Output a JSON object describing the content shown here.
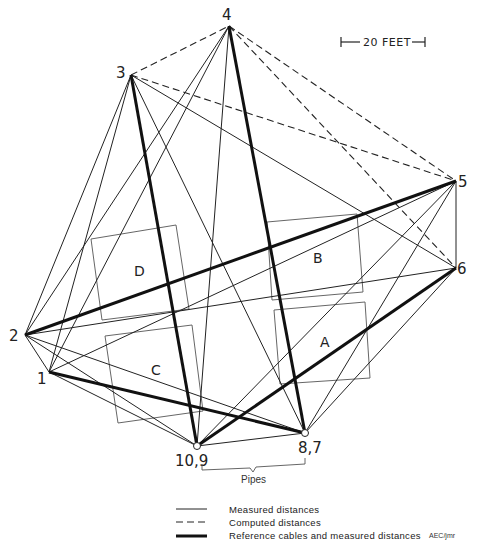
{
  "scale_bar": {
    "label": "20 FEET"
  },
  "points": [
    {
      "id": "1",
      "label": "1"
    },
    {
      "id": "2",
      "label": "2"
    },
    {
      "id": "3",
      "label": "3"
    },
    {
      "id": "4",
      "label": "4"
    },
    {
      "id": "5",
      "label": "5"
    },
    {
      "id": "6",
      "label": "6"
    },
    {
      "id": "87",
      "label": "8,7"
    },
    {
      "id": "109",
      "label": "10,9"
    }
  ],
  "squares": [
    {
      "id": "A",
      "label": "A"
    },
    {
      "id": "B",
      "label": "B"
    },
    {
      "id": "C",
      "label": "C"
    },
    {
      "id": "D",
      "label": "D"
    }
  ],
  "connections": {
    "computed": [
      [
        "3",
        "4"
      ],
      [
        "3",
        "5"
      ],
      [
        "4",
        "5"
      ],
      [
        "4",
        "6"
      ]
    ],
    "reference": [
      [
        "3",
        "109"
      ],
      [
        "4",
        "87"
      ],
      [
        "5",
        "2"
      ],
      [
        "6",
        "109"
      ],
      [
        "1",
        "87"
      ]
    ],
    "measured": [
      [
        "3",
        "2"
      ],
      [
        "3",
        "1"
      ],
      [
        "3",
        "87"
      ],
      [
        "3",
        "6"
      ],
      [
        "4",
        "2"
      ],
      [
        "4",
        "1"
      ],
      [
        "4",
        "109"
      ],
      [
        "5",
        "6"
      ],
      [
        "5",
        "109"
      ],
      [
        "5",
        "87"
      ],
      [
        "5",
        "1"
      ],
      [
        "6",
        "2"
      ],
      [
        "6",
        "87"
      ],
      [
        "2",
        "1"
      ],
      [
        "2",
        "109"
      ],
      [
        "2",
        "87"
      ],
      [
        "1",
        "109"
      ],
      [
        "109",
        "87"
      ]
    ]
  },
  "pipes_label": "Pipes",
  "legend": {
    "measured": "Measured distances",
    "computed": "Computed distances",
    "reference": "Reference cables and measured distances"
  },
  "credit": "AEC/jmr"
}
